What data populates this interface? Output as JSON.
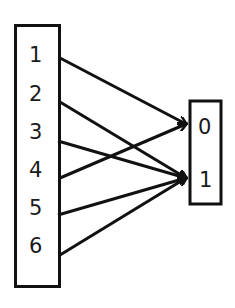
{
  "diagram": {
    "type": "function-mapping",
    "domain": {
      "labels": [
        "1",
        "2",
        "3",
        "4",
        "5",
        "6"
      ]
    },
    "codomain": {
      "labels": [
        "0",
        "1"
      ]
    },
    "mappings": [
      {
        "from": "1",
        "to": "0"
      },
      {
        "from": "2",
        "to": "1"
      },
      {
        "from": "3",
        "to": "1"
      },
      {
        "from": "4",
        "to": "0"
      },
      {
        "from": "5",
        "to": "1"
      },
      {
        "from": "6",
        "to": "1"
      }
    ],
    "colors": {
      "stroke": "#111111",
      "background": "#ffffff"
    }
  }
}
